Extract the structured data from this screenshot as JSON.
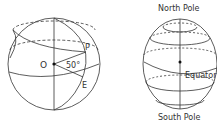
{
  "diagram": {
    "left_sphere": {
      "labels": {
        "center": "O",
        "point_p": "P",
        "point_e": "E",
        "angle": "50°"
      }
    },
    "right_sphere": {
      "labels": {
        "north": "North Pole",
        "south": "South Pole",
        "equator": "Equator"
      }
    },
    "colors": {
      "stroke": "#333333",
      "background": "#ffffff"
    }
  }
}
